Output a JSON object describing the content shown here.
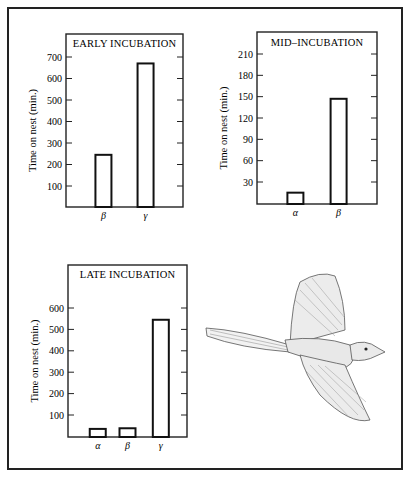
{
  "chart_data": [
    {
      "type": "bar",
      "title": "EARLY INCUBATION",
      "ylabel": "Time on nest (min.)",
      "xlabel": "",
      "categories": [
        "β",
        "γ"
      ],
      "values": [
        245,
        670
      ],
      "yticks": [
        100,
        200,
        300,
        400,
        500,
        600,
        700
      ],
      "ylim": [
        0,
        740
      ],
      "grid": false,
      "legend": null
    },
    {
      "type": "bar",
      "title": "MID–INCUBATION",
      "ylabel": "Time on nest (min.)",
      "xlabel": "",
      "categories": [
        "α",
        "β"
      ],
      "values": [
        15,
        147
      ],
      "yticks": [
        30,
        60,
        90,
        120,
        150,
        180,
        210
      ],
      "ylim": [
        0,
        245
      ],
      "grid": false,
      "legend": null
    },
    {
      "type": "bar",
      "title": "LATE INCUBATION",
      "ylabel": "Time on nest (min.)",
      "xlabel": "",
      "categories": [
        "α",
        "β",
        "γ"
      ],
      "values": [
        35,
        38,
        545
      ],
      "yticks": [
        100,
        200,
        300,
        400,
        500,
        600
      ],
      "ylim": [
        0,
        810
      ],
      "grid": false,
      "legend": null
    }
  ],
  "illustration": {
    "subject": "bird-in-flight"
  },
  "colors": {
    "ink": "#1a1a1a",
    "bar_fill": "#ffffff",
    "background": "#ffffff"
  }
}
